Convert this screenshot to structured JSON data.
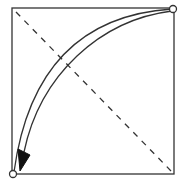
{
  "diagram": {
    "type": "origami-fold-step",
    "colors": {
      "line": "#333333",
      "background": "#ffffff"
    },
    "square": {
      "x": 12,
      "y": 8,
      "size": 162
    },
    "diagonal": {
      "x1": 15,
      "y1": 11,
      "x2": 174,
      "y2": 174,
      "style": "dashed"
    },
    "points": [
      {
        "name": "top-right-corner",
        "cx": 173,
        "cy": 9
      },
      {
        "name": "bottom-left-corner",
        "cx": 13,
        "cy": 174
      }
    ],
    "arrow": {
      "from": "top-right-corner",
      "to": "bottom-left-corner",
      "style": "hollow-curved"
    }
  }
}
